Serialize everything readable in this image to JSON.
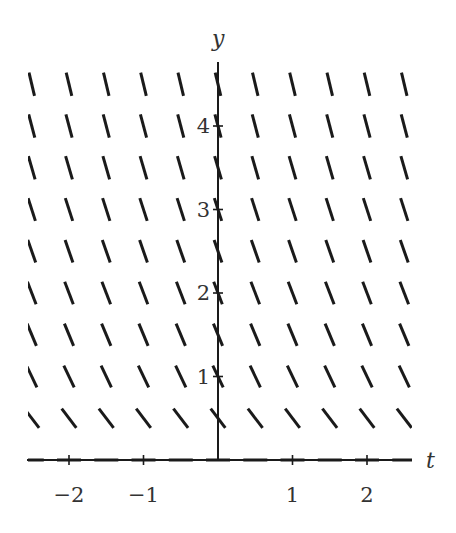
{
  "chart_data": {
    "type": "slope_field",
    "title": "",
    "xlabel": "t",
    "ylabel": "y",
    "x_ticks": [
      {
        "value": -2,
        "label": "−2"
      },
      {
        "value": -1,
        "label": "−1"
      },
      {
        "value": 1,
        "label": "1"
      },
      {
        "value": 2,
        "label": "2"
      }
    ],
    "y_ticks": [
      {
        "value": 1,
        "label": "1"
      },
      {
        "value": 2,
        "label": "2"
      },
      {
        "value": 3,
        "label": "3"
      },
      {
        "value": 4,
        "label": "4"
      }
    ],
    "xlim": [
      -2.65,
      2.65
    ],
    "ylim": [
      0,
      4.65
    ],
    "grid": false,
    "t_samples": [
      -2.5,
      -2.0,
      -1.5,
      -1.0,
      -0.5,
      0.0,
      0.5,
      1.0,
      1.5,
      2.0,
      2.5
    ],
    "rows": [
      {
        "y": 0.0,
        "display_slope": 0.0
      },
      {
        "y": 0.5,
        "display_slope": 1.3
      },
      {
        "y": 1.0,
        "display_slope": 2.1
      },
      {
        "y": 1.5,
        "display_slope": 2.4
      },
      {
        "y": 2.0,
        "display_slope": 2.6
      },
      {
        "y": 2.5,
        "display_slope": 2.9
      },
      {
        "y": 3.0,
        "display_slope": 3.1
      },
      {
        "y": 3.5,
        "display_slope": 3.4
      },
      {
        "y": 4.0,
        "display_slope": 3.8
      },
      {
        "y": 4.5,
        "display_slope": 4.2
      }
    ],
    "slope_sign": "negative (segments fall left-to-right, steepening as y increases; independent of t)",
    "segment_length_px": 24
  },
  "layout": {
    "origin_px": [
      218,
      460
    ],
    "px_per_t": 74.5,
    "px_per_y": 83.5,
    "x_axis_px": [
      27,
      412
    ],
    "y_axis_top_px": 62,
    "clip_left_px": 28,
    "clip_right_px": 412
  }
}
